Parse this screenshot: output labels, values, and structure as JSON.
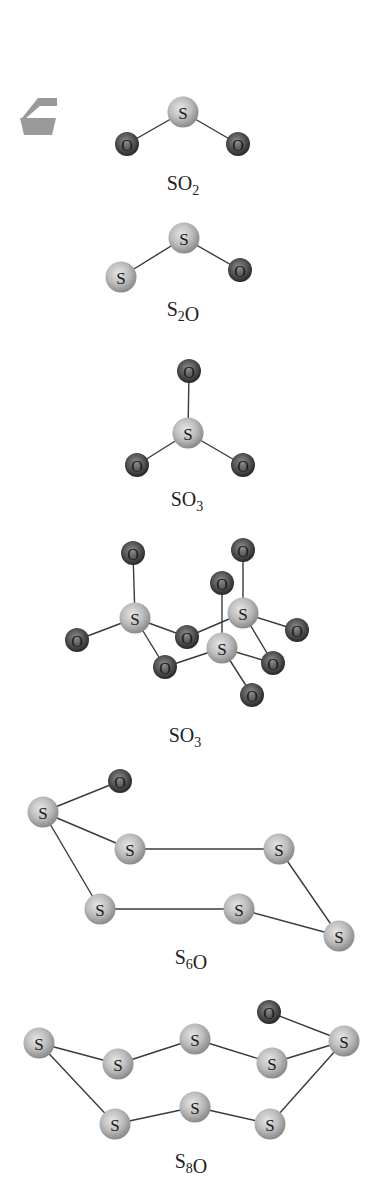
{
  "colors": {
    "sulfur_fill": "#bdbdbd",
    "sulfur_highlight": "#e2e2e2",
    "sulfur_edge": "#8c8c8c",
    "oxygen_fill": "#5a5a5a",
    "oxygen_highlight": "#8a8a8a",
    "oxygen_edge": "#262626",
    "bond": "#3a3a3a",
    "icon": "#9a9a9a"
  },
  "icon": {
    "name": "tray-icon"
  },
  "molecules": [
    {
      "id": "so2",
      "formula": {
        "parts": [
          {
            "t": "SO"
          },
          {
            "t": "2",
            "sub": true
          }
        ]
      },
      "label_pos": [
        183,
        190
      ],
      "atoms": [
        {
          "el": "S",
          "x": 183,
          "y": 112
        },
        {
          "el": "O",
          "x": 127,
          "y": 144
        },
        {
          "el": "O",
          "x": 238,
          "y": 144
        }
      ],
      "bonds": [
        [
          0,
          1
        ],
        [
          0,
          2
        ]
      ]
    },
    {
      "id": "s2o",
      "formula": {
        "parts": [
          {
            "t": "S"
          },
          {
            "t": "2",
            "sub": true
          },
          {
            "t": "O"
          }
        ]
      },
      "label_pos": [
        183,
        316
      ],
      "atoms": [
        {
          "el": "S",
          "x": 184,
          "y": 238
        },
        {
          "el": "S",
          "x": 121,
          "y": 277
        },
        {
          "el": "O",
          "x": 240,
          "y": 270
        }
      ],
      "bonds": [
        [
          0,
          1
        ],
        [
          0,
          2
        ]
      ]
    },
    {
      "id": "so3-monomer",
      "formula": {
        "parts": [
          {
            "t": "SO"
          },
          {
            "t": "3",
            "sub": true
          }
        ]
      },
      "label_pos": [
        187,
        506
      ],
      "atoms": [
        {
          "el": "S",
          "x": 188,
          "y": 433
        },
        {
          "el": "O",
          "x": 189,
          "y": 371
        },
        {
          "el": "O",
          "x": 137,
          "y": 465
        },
        {
          "el": "O",
          "x": 243,
          "y": 465
        }
      ],
      "bonds": [
        [
          0,
          1
        ],
        [
          0,
          2
        ],
        [
          0,
          3
        ]
      ]
    },
    {
      "id": "so3-trimer",
      "formula": {
        "parts": [
          {
            "t": "SO"
          },
          {
            "t": "3",
            "sub": true
          }
        ]
      },
      "label_pos": [
        185,
        742
      ],
      "atoms": [
        {
          "el": "O",
          "x": 133,
          "y": 553
        },
        {
          "el": "O",
          "x": 77,
          "y": 640
        },
        {
          "el": "S",
          "x": 135,
          "y": 618
        },
        {
          "el": "O",
          "x": 165,
          "y": 667
        },
        {
          "el": "O",
          "x": 187,
          "y": 637
        },
        {
          "el": "O",
          "x": 243,
          "y": 550
        },
        {
          "el": "O",
          "x": 222,
          "y": 583
        },
        {
          "el": "S",
          "x": 243,
          "y": 613
        },
        {
          "el": "O",
          "x": 297,
          "y": 630
        },
        {
          "el": "S",
          "x": 222,
          "y": 648
        },
        {
          "el": "O",
          "x": 273,
          "y": 663
        },
        {
          "el": "O",
          "x": 252,
          "y": 695
        }
      ],
      "bonds": [
        [
          2,
          0
        ],
        [
          2,
          1
        ],
        [
          2,
          3
        ],
        [
          2,
          4
        ],
        [
          4,
          7
        ],
        [
          7,
          5
        ],
        [
          7,
          8
        ],
        [
          7,
          10
        ],
        [
          6,
          9
        ],
        [
          9,
          3
        ],
        [
          9,
          10
        ],
        [
          9,
          11
        ]
      ]
    },
    {
      "id": "s6o",
      "formula": {
        "parts": [
          {
            "t": "S"
          },
          {
            "t": "6",
            "sub": true
          },
          {
            "t": "O"
          }
        ]
      },
      "label_pos": [
        191,
        964
      ],
      "atoms": [
        {
          "el": "O",
          "x": 120,
          "y": 781
        },
        {
          "el": "S",
          "x": 43,
          "y": 812
        },
        {
          "el": "S",
          "x": 130,
          "y": 849
        },
        {
          "el": "S",
          "x": 279,
          "y": 849
        },
        {
          "el": "S",
          "x": 100,
          "y": 909
        },
        {
          "el": "S",
          "x": 239,
          "y": 909
        },
        {
          "el": "S",
          "x": 339,
          "y": 936
        }
      ],
      "bonds": [
        [
          1,
          0
        ],
        [
          1,
          2
        ],
        [
          2,
          3
        ],
        [
          3,
          6
        ],
        [
          6,
          5
        ],
        [
          5,
          4
        ],
        [
          4,
          1
        ]
      ]
    },
    {
      "id": "s8o",
      "formula": {
        "parts": [
          {
            "t": "S"
          },
          {
            "t": "8",
            "sub": true
          },
          {
            "t": "O"
          }
        ]
      },
      "label_pos": [
        191,
        1168
      ],
      "atoms": [
        {
          "el": "O",
          "x": 269,
          "y": 1012
        },
        {
          "el": "S",
          "x": 39,
          "y": 1043
        },
        {
          "el": "S",
          "x": 118,
          "y": 1064
        },
        {
          "el": "S",
          "x": 195,
          "y": 1039
        },
        {
          "el": "S",
          "x": 272,
          "y": 1063
        },
        {
          "el": "S",
          "x": 344,
          "y": 1041
        },
        {
          "el": "S",
          "x": 115,
          "y": 1124
        },
        {
          "el": "S",
          "x": 195,
          "y": 1107
        },
        {
          "el": "S",
          "x": 270,
          "y": 1124
        }
      ],
      "bonds": [
        [
          5,
          0
        ],
        [
          1,
          2
        ],
        [
          2,
          3
        ],
        [
          3,
          4
        ],
        [
          4,
          5
        ],
        [
          5,
          8
        ],
        [
          8,
          7
        ],
        [
          7,
          6
        ],
        [
          6,
          1
        ]
      ]
    }
  ]
}
